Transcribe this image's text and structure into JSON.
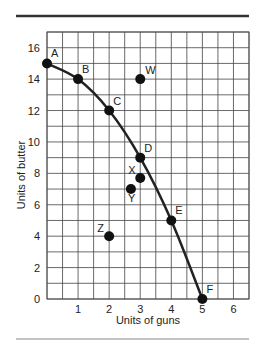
{
  "chart_data": {
    "type": "line",
    "title": "",
    "xlabel": "Units of guns",
    "ylabel": "Units of butter",
    "xlim": [
      0,
      6.5
    ],
    "ylim": [
      0,
      17
    ],
    "x_ticks": [
      "1",
      "2",
      "3",
      "4",
      "5",
      "6"
    ],
    "x_tick_values": [
      1,
      2,
      3,
      4,
      5,
      6
    ],
    "y_ticks": [
      "0",
      "2",
      "4",
      "6",
      "8",
      "10",
      "12",
      "14",
      "16"
    ],
    "y_tick_values": [
      0,
      2,
      4,
      6,
      8,
      10,
      12,
      14,
      16
    ],
    "grid": true,
    "grid_x_step": 0.5,
    "grid_y_step": 1,
    "legend": null,
    "series": [
      {
        "name": "Production possibilities frontier",
        "points": [
          {
            "label": "A",
            "x": 0,
            "y": 15
          },
          {
            "label": "B",
            "x": 1,
            "y": 14
          },
          {
            "label": "C",
            "x": 2,
            "y": 12
          },
          {
            "label": "D",
            "x": 3,
            "y": 9
          },
          {
            "label": "E",
            "x": 4,
            "y": 5
          },
          {
            "label": "F",
            "x": 5,
            "y": 0
          }
        ]
      }
    ],
    "other_points": [
      {
        "label": "W",
        "x": 3,
        "y": 14
      },
      {
        "label": "X",
        "x": 3,
        "y": 7.7
      },
      {
        "label": "Y",
        "x": 2.7,
        "y": 7
      },
      {
        "label": "Z",
        "x": 2,
        "y": 4
      }
    ],
    "colors": {
      "curve": "#222222",
      "grid": "#444444",
      "rule": "#333333"
    }
  }
}
